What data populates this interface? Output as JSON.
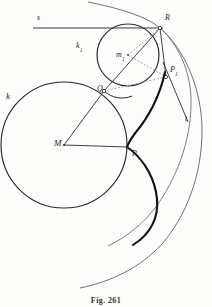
{
  "figure": {
    "caption": "Fig. 261",
    "title": "Fig. 261",
    "background_color": "#fdfdfc",
    "ink_color": "#26242a",
    "thick_curve_color": "#141218",
    "thin_curve_color": "#55515a",
    "dashed_color": "#7d7984"
  },
  "labels": {
    "line_s": {
      "text": "s",
      "x": 37,
      "y": 18,
      "size": "md"
    },
    "circle_k": {
      "text": "k",
      "x": 6,
      "y": 96,
      "size": "lg"
    },
    "circle_k1_base": {
      "text": "k",
      "sub": "1",
      "x": 76,
      "y": 46,
      "size": "md"
    },
    "center_m1_base": {
      "text": "m",
      "sub": "1",
      "x": 116,
      "y": 55,
      "size": "md"
    },
    "center_M": {
      "text": "M",
      "x": 56,
      "y": 142,
      "size": "lg"
    },
    "point_Q": {
      "text": "Q",
      "x": 98,
      "y": 84,
      "size": "md"
    },
    "point_R": {
      "text": "R",
      "x": 165,
      "y": 17,
      "size": "md"
    },
    "point_P": {
      "text": "P",
      "x": 133,
      "y": 152,
      "size": "md"
    },
    "point_P1_base": {
      "text": "P",
      "sub": "1",
      "x": 170,
      "y": 68,
      "size": "md"
    },
    "tangent_t": {
      "text": "t",
      "x": 185,
      "y": 118,
      "size": "md"
    }
  },
  "geometry": {
    "big_circle": {
      "name": "k",
      "cx": 64,
      "cy": 145,
      "r": 63
    },
    "small_circle": {
      "name": "k1",
      "cx": 128,
      "cy": 55,
      "r": 31
    },
    "points": {
      "M": {
        "x": 64,
        "y": 145
      },
      "Q": {
        "x": 104,
        "y": 91
      },
      "R": {
        "x": 160,
        "y": 28
      },
      "P": {
        "x": 127,
        "y": 147
      },
      "P1": {
        "x": 166,
        "y": 77
      },
      "m1": {
        "x": 128,
        "y": 55
      }
    },
    "horizontal_line_s": {
      "x1": 33,
      "y1": 28,
      "x2": 163,
      "y2": 28
    },
    "radii": [
      {
        "from": "M",
        "to": "Q"
      },
      {
        "from": "M",
        "to": "P"
      }
    ],
    "chords": [
      {
        "from": "Q",
        "to": "R"
      },
      {
        "from": "R",
        "to": "P1"
      }
    ],
    "dashed_lines": [
      {
        "from": "m1",
        "to": "R"
      },
      {
        "from": "m1",
        "to": "P1"
      },
      {
        "from": "Q",
        "to": "P1"
      }
    ],
    "tangent_segment": {
      "x1": 163,
      "y1": 62,
      "x2": 188,
      "y2": 122
    },
    "curve_types": {
      "thick": "epicycloid-arc",
      "thin": "construction-arc"
    }
  }
}
